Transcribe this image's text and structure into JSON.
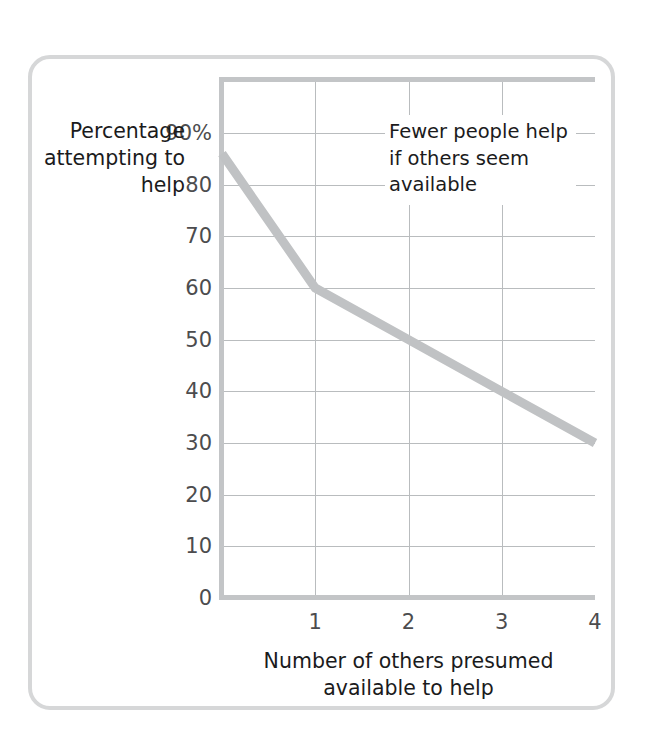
{
  "figure": {
    "card_border_color": "#d6d7d8",
    "background": "#ffffff"
  },
  "annotation": {
    "text": "Fewer people help\nif others seem\navailable"
  },
  "chart_data": {
    "type": "line",
    "title": "",
    "subtitle": "",
    "xlabel": "Number of others\npresumed available to help",
    "ylabel": "Percentage\nattempting\nto help",
    "x": [
      0,
      1,
      2,
      3,
      4
    ],
    "series": [
      {
        "name": "Percentage attempting to help",
        "values": [
          86,
          60,
          50,
          40,
          30
        ],
        "color": "#c0c2c4",
        "line_width": 9
      }
    ],
    "xlim": [
      0,
      4
    ],
    "ylim": [
      0,
      100
    ],
    "x_ticks": [
      "1",
      "2",
      "3",
      "4"
    ],
    "x_tick_values": [
      1,
      2,
      3,
      4
    ],
    "y_ticks": [
      "0",
      "10",
      "20",
      "30",
      "40",
      "50",
      "60",
      "70",
      "80",
      "90%"
    ],
    "y_tick_values": [
      0,
      10,
      20,
      30,
      40,
      50,
      60,
      70,
      80,
      90
    ],
    "grid": true,
    "grid_color": "#b9bcbe",
    "axis_color": "#c3c5c7",
    "tick_label_color": "#4c4c4e",
    "legend": "none",
    "annotations": [
      {
        "text": "Fewer people help\nif others seem\navailable",
        "x": 1.75,
        "y": 90
      }
    ]
  }
}
